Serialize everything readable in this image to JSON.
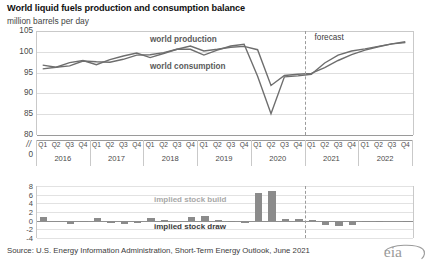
{
  "header": {
    "title": "World liquid fuels production and consumption balance",
    "subtitle": "million barrels per day"
  },
  "source": "Source: U.S. Energy Information Administration, Short-Term Energy Outlook, June 2021",
  "logo_text": "eia",
  "annotations": {
    "production_label": "world production",
    "consumption_label": "world consumption",
    "forecast_label": "forecast",
    "stock_build_label": "implied stock build",
    "stock_draw_label": "implied stock draw",
    "axis_break": "//"
  },
  "colors": {
    "line": "#6e6e6e",
    "bar": "#8b8b8b",
    "grid": "#dedede",
    "axis": "#9a9a9a",
    "text": "#3b3b3b",
    "label_gray": "#a8a8a8"
  },
  "chart_data": [
    {
      "type": "line",
      "title": "World liquid fuels production and consumption balance",
      "ylabel": "million barrels per day",
      "xlabel": "",
      "ylim": [
        80,
        105
      ],
      "yticks": [
        105,
        100,
        95,
        90,
        85,
        80
      ],
      "ytick_labels": [
        "105",
        "100",
        "95",
        "90",
        "85",
        "80"
      ],
      "axis_break_labels": [
        "//",
        "0"
      ],
      "grid": true,
      "legend": "inline",
      "forecast_start": "2021 Q1",
      "categories": [
        "2016 Q1",
        "2016 Q2",
        "2016 Q3",
        "2016 Q4",
        "2017 Q1",
        "2017 Q2",
        "2017 Q3",
        "2017 Q4",
        "2018 Q1",
        "2018 Q2",
        "2018 Q3",
        "2018 Q4",
        "2019 Q1",
        "2019 Q2",
        "2019 Q3",
        "2019 Q4",
        "2020 Q1",
        "2020 Q2",
        "2020 Q3",
        "2020 Q4",
        "2021 Q1",
        "2021 Q2",
        "2021 Q3",
        "2021 Q4",
        "2022 Q1",
        "2022 Q2",
        "2022 Q3",
        "2022 Q4"
      ],
      "years": [
        "2016",
        "2017",
        "2018",
        "2019",
        "2020",
        "2021",
        "2022"
      ],
      "quarters": [
        "Q1",
        "Q2",
        "Q3",
        "Q4"
      ],
      "series": [
        {
          "name": "world production",
          "values": [
            96.8,
            96.3,
            96.6,
            97.8,
            97.6,
            97.5,
            98.2,
            99.2,
            99.3,
            99.8,
            100.6,
            101.4,
            100.2,
            100.6,
            101.1,
            101.3,
            100.5,
            91.9,
            94.3,
            94.6,
            94.8,
            96.2,
            97.9,
            99.3,
            100.4,
            101.2,
            101.9,
            102.2
          ]
        },
        {
          "name": "world consumption",
          "values": [
            95.9,
            96.3,
            97.4,
            97.9,
            96.9,
            98.1,
            99.0,
            99.7,
            98.6,
            99.6,
            100.6,
            100.6,
            99.2,
            100.4,
            101.4,
            101.8,
            94.1,
            85.1,
            94.0,
            94.2,
            94.6,
            97.3,
            99.2,
            100.2,
            100.7,
            101.3,
            101.9,
            102.4
          ]
        }
      ]
    },
    {
      "type": "bar",
      "title": "implied stock change",
      "ylabel": "",
      "ylim": [
        -4,
        8
      ],
      "yticks": [
        8,
        6,
        4,
        2,
        0,
        -2,
        -4
      ],
      "ytick_labels": [
        "8",
        "6",
        "4",
        "2",
        "0",
        "-2",
        "-4"
      ],
      "grid": true,
      "forecast_start": "2021 Q1",
      "categories": [
        "2016 Q1",
        "2016 Q2",
        "2016 Q3",
        "2016 Q4",
        "2017 Q1",
        "2017 Q2",
        "2017 Q3",
        "2017 Q4",
        "2018 Q1",
        "2018 Q2",
        "2018 Q3",
        "2018 Q4",
        "2019 Q1",
        "2019 Q2",
        "2019 Q3",
        "2019 Q4",
        "2020 Q1",
        "2020 Q2",
        "2020 Q3",
        "2020 Q4",
        "2021 Q1",
        "2021 Q2",
        "2021 Q3",
        "2021 Q4",
        "2022 Q1",
        "2022 Q2",
        "2022 Q3",
        "2022 Q4"
      ],
      "values": [
        0.9,
        0.0,
        -0.8,
        -0.1,
        0.7,
        -0.6,
        -0.8,
        -0.5,
        0.7,
        0.2,
        0.0,
        0.8,
        1.0,
        0.2,
        -0.3,
        -0.5,
        6.4,
        6.8,
        0.3,
        0.4,
        0.2,
        -1.1,
        -1.3,
        -0.9,
        -0.3,
        -0.1,
        0.0,
        -0.2
      ]
    }
  ]
}
